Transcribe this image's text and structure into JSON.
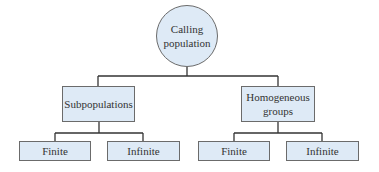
{
  "diagram": {
    "type": "tree",
    "colors": {
      "fill": "#deeaf6",
      "stroke": "#6b6b6b",
      "line": "#333333"
    },
    "root": {
      "label_line1": "Calling",
      "label_line2": "population"
    },
    "level1": [
      {
        "label_line1": "Subpopulations",
        "label_line2": ""
      },
      {
        "label_line1": "Homogeneous",
        "label_line2": "groups"
      }
    ],
    "level2": [
      {
        "label": "Finite"
      },
      {
        "label": "Infinite"
      },
      {
        "label": "Finite"
      },
      {
        "label": "Infinite"
      }
    ]
  }
}
